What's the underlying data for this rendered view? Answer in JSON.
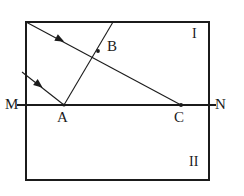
{
  "figure": {
    "kind": "optics-ray-diagram",
    "title": "",
    "background_color": "#ffffff",
    "stroke_color": "#1b1b1b",
    "label_color": "#1b1b1b",
    "labels": {
      "M": "M",
      "N": "N",
      "A": "A",
      "B": "B",
      "C": "C",
      "region_I": "I",
      "region_II": "II"
    }
  },
  "chart_data": {
    "type": "diagram",
    "title": "",
    "xlabel": "",
    "ylabel": "",
    "canvas": {
      "width": 244,
      "height": 196
    },
    "boundary_rectangle": {
      "name": "medium-boundary-rectangle",
      "x1": 26,
      "y1": 22,
      "x2": 209,
      "y2": 180,
      "stroke": "#1b1b1b",
      "stroke_width": 1.1
    },
    "interface_line": {
      "name": "interface-MN",
      "from_label": "M",
      "to_label": "N",
      "x1": 17,
      "y1": 105,
      "x2": 216,
      "y2": 105,
      "stroke": "#1b1b1b",
      "stroke_width": 1.1
    },
    "points": [
      {
        "label": "A",
        "x": 64,
        "y": 105,
        "dot": true,
        "dot_r": 1.6,
        "label_dx": -7,
        "label_dy": 17
      },
      {
        "label": "B",
        "x": 98,
        "y": 51,
        "dot": true,
        "dot_r": 1.9,
        "label_dx": 9,
        "label_dy": -2
      },
      {
        "label": "C",
        "x": 181,
        "y": 105,
        "dot": true,
        "dot_r": 2.0,
        "label_dx": -7,
        "label_dy": 17
      }
    ],
    "rays": [
      {
        "name": "incident-ray-upper",
        "x1": 26,
        "y1": 22,
        "x2": 181,
        "y2": 105,
        "stroke": "#1b1b1b",
        "stroke_width": 1.1,
        "arrow": {
          "at_x": 59,
          "at_y": 39,
          "angle_deg": 28.2,
          "size": 6
        }
      },
      {
        "name": "incident-ray-lower",
        "x1": 22,
        "y1": 72,
        "x2": 64,
        "y2": 105,
        "stroke": "#1b1b1b",
        "stroke_width": 1.1,
        "arrow": {
          "at_x": 38,
          "at_y": 84,
          "angle_deg": 38.2,
          "size": 6
        }
      },
      {
        "name": "refracted-ray-A-to-top",
        "x1": 64,
        "y1": 105,
        "x2": 113,
        "y2": 22,
        "stroke": "#1b1b1b",
        "stroke_width": 1.1,
        "arrow": null
      }
    ],
    "regions": [
      {
        "label": "I",
        "x": 196,
        "y": 35,
        "description": "region above interface"
      },
      {
        "label": "II",
        "x": 195,
        "y": 163,
        "description": "region below interface"
      }
    ],
    "axis_ranges": {
      "x": [
        0,
        244
      ],
      "y": [
        0,
        196
      ]
    },
    "grid": false,
    "legend": null
  }
}
